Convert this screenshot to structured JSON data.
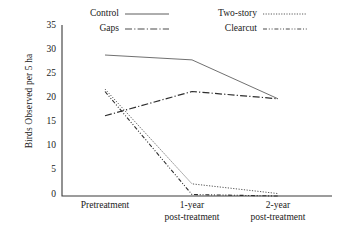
{
  "chart_data": {
    "type": "line",
    "title": "",
    "xlabel": "",
    "ylabel": "Birds Observed per 5 ha",
    "categories": [
      "Pretreatment",
      "1-year post-treatment",
      "2-year post-treatment"
    ],
    "ylim": [
      0,
      35
    ],
    "yticks": [
      0,
      5,
      10,
      15,
      20,
      25,
      30,
      35
    ],
    "grid": false,
    "legend_position": "top",
    "series": [
      {
        "name": "Control",
        "values": [
          29,
          28,
          20
        ],
        "style": "solid"
      },
      {
        "name": "Gaps",
        "values": [
          16.5,
          21.5,
          20
        ],
        "style": "dash-dot"
      },
      {
        "name": "Two-story",
        "values": [
          22,
          2.5,
          0.5
        ],
        "style": "dotted"
      },
      {
        "name": "Clearcut",
        "values": [
          21.5,
          0.3,
          0
        ],
        "style": "dash-dot-dot"
      }
    ]
  },
  "axis": {
    "y_title": "Birds Observed per 5 ha",
    "y_ticks": [
      "35",
      "30",
      "25",
      "20",
      "15",
      "10",
      "5",
      "0"
    ],
    "x_ticks": [
      {
        "line1": "Pretreatment",
        "line2": ""
      },
      {
        "line1": "1-year",
        "line2": "post-treatment"
      },
      {
        "line1": "2-year",
        "line2": "post-treatment"
      }
    ]
  },
  "legend": {
    "items": [
      {
        "label": "Control",
        "style": "solid"
      },
      {
        "label": "Two-story",
        "style": "dotted"
      },
      {
        "label": "Gaps",
        "style": "dash-dot"
      },
      {
        "label": "Clearcut",
        "style": "dash-dot-dot"
      }
    ]
  },
  "colors": {
    "axis": "#3a3a3a",
    "line": "#4a4a4a",
    "text": "#1a1a1a",
    "background": "#ffffff"
  }
}
